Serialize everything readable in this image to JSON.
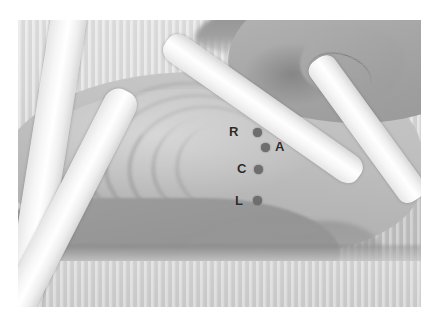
{
  "image": {
    "title": "ECG electrode placement photograph",
    "modality": "clinical-photograph",
    "subject": "patient torso, supine, with restraint straps",
    "colorspace": "grayscale",
    "frame": {
      "x": 18,
      "y": 20,
      "width": 403,
      "height": 287
    },
    "canvas": {
      "width": 439,
      "height": 328,
      "background": "#ffffff"
    }
  },
  "palette": {
    "page_background": "#ffffff",
    "skin_mid": "#bdbdbd",
    "skin_light": "#dcdcdc",
    "skin_dark": "#9b9b9b",
    "strap_white": "#ffffff",
    "marker_gray": "#6e6e6e",
    "label_black": "#2b2b2b"
  },
  "electrodes": [
    {
      "label": "R",
      "name": "electrode-r",
      "label_pos": {
        "x": 229,
        "y": 125
      },
      "dot_pos": {
        "x": 253,
        "y": 128
      },
      "label_side": "left"
    },
    {
      "label": "A",
      "name": "electrode-a",
      "label_pos": {
        "x": 275,
        "y": 140
      },
      "dot_pos": {
        "x": 261,
        "y": 143
      },
      "label_side": "right"
    },
    {
      "label": "C",
      "name": "electrode-c",
      "label_pos": {
        "x": 237,
        "y": 162
      },
      "dot_pos": {
        "x": 254,
        "y": 165
      },
      "label_side": "left"
    },
    {
      "label": "L",
      "name": "electrode-l",
      "label_pos": {
        "x": 235,
        "y": 194
      },
      "dot_pos": {
        "x": 253,
        "y": 196
      },
      "label_side": "left"
    }
  ],
  "straps": [
    {
      "name": "strap-left-upper"
    },
    {
      "name": "strap-left-lower"
    },
    {
      "name": "strap-right-upper"
    },
    {
      "name": "strap-right-lower"
    }
  ]
}
